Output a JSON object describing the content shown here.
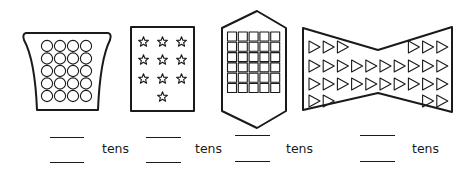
{
  "colors": {
    "ink": "#1a1a1a",
    "background": "#ffffff"
  },
  "unit_label": "tens",
  "groups": [
    {
      "id": "circles",
      "shape": "curved-trapezoid",
      "item_icon": "circle-icon",
      "layout": {
        "columns": 4,
        "rows": 5,
        "row_counts": [
          4,
          4,
          4,
          4,
          4
        ]
      },
      "item_count": 20,
      "answer_blanks": [
        "",
        ""
      ],
      "label": "tens"
    },
    {
      "id": "stars",
      "shape": "rectangle",
      "item_icon": "star-icon",
      "layout": {
        "columns": 3,
        "rows": 4,
        "row_counts": [
          3,
          3,
          3,
          1
        ]
      },
      "item_count": 10,
      "answer_blanks": [
        "",
        ""
      ],
      "label": "tens"
    },
    {
      "id": "squares",
      "shape": "hexagon",
      "item_icon": "square-icon",
      "layout": {
        "columns": 5,
        "rows": 6,
        "row_counts": [
          5,
          5,
          5,
          5,
          5,
          5
        ]
      },
      "item_count": 30,
      "answer_blanks": [
        "",
        ""
      ],
      "label": "tens"
    },
    {
      "id": "triangles",
      "shape": "bowtie",
      "item_icon": "triangle-icon",
      "layout": {
        "rows": 4,
        "row_counts": [
          6,
          10,
          10,
          4
        ]
      },
      "item_count": 30,
      "answer_blanks": [
        "",
        ""
      ],
      "label": "tens"
    }
  ]
}
